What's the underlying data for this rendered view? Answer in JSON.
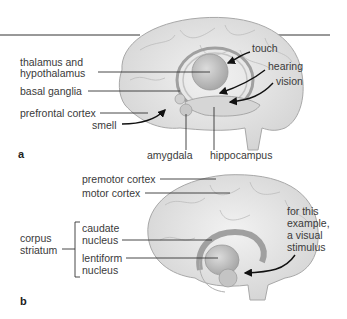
{
  "figure": {
    "panel_a": {
      "letter": "a",
      "labels": {
        "thalamus_line1": "thalamus and",
        "thalamus_line2": "hypothalamus",
        "basal_ganglia": "basal ganglia",
        "prefrontal_cortex": "prefrontal cortex",
        "smell": "smell",
        "amygdala": "amygdala",
        "hippocampus": "hippocampus",
        "touch": "touch",
        "hearing": "hearing",
        "vision": "vision"
      }
    },
    "panel_b": {
      "letter": "b",
      "labels": {
        "premotor_cortex": "premotor cortex",
        "motor_cortex": "motor cortex",
        "corpus_line1": "corpus",
        "corpus_line2": "striatum",
        "caudate_line1": "caudate",
        "caudate_line2": "nucleus",
        "lentiform_line1": "lentiform",
        "lentiform_line2": "nucleus",
        "stimulus_line1": "for this",
        "stimulus_line2": "example,",
        "stimulus_line3": "a visual",
        "stimulus_line4": "stimulus"
      }
    },
    "colors": {
      "brain_fill": "#e6e6e6",
      "brain_stroke": "#a8a8a8",
      "inner_fill": "#cfcfcf",
      "leader_line": "#333333",
      "arrow": "#111111"
    }
  }
}
